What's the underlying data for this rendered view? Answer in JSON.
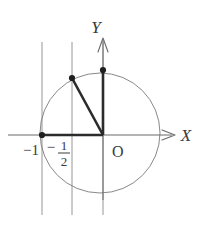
{
  "figure": {
    "axes": {
      "x_label": "X",
      "y_label": "Y",
      "origin_label": "O"
    },
    "tick_labels": [
      {
        "name": "minus-one",
        "text": "−1",
        "x": -1
      },
      {
        "name": "minus-one-half",
        "minus": "−",
        "numerator": "1",
        "denominator": "2",
        "x": -0.5
      }
    ],
    "colors": {
      "stroke_thin": "#6b6b6b",
      "stroke_thick": "#2b2b2b",
      "text": "#3a3a3a",
      "background": "#ffffff"
    },
    "geometry": {
      "circle": {
        "cx": 100,
        "cy": 133,
        "r": 60
      },
      "x_axis": {
        "y": 135,
        "x1": 8,
        "x2": 178
      },
      "y_axis": {
        "x": 103,
        "y1": 200,
        "y2": 38
      },
      "gridlines": [
        {
          "name": "gridline-minus-one",
          "x": 42,
          "y1": 42,
          "y2": 215
        },
        {
          "name": "gridline-minus-one-half",
          "x": 72,
          "y1": 42,
          "y2": 215
        },
        {
          "name": "gridline-y-axis",
          "x": 103,
          "y1": 42,
          "y2": 215
        }
      ],
      "points": [
        {
          "name": "point-minus-one",
          "x": 42,
          "y": 135
        },
        {
          "name": "point-upper-left",
          "x": 72,
          "y": 78
        },
        {
          "name": "point-top",
          "x": 103,
          "y": 70
        }
      ],
      "segments": [
        {
          "name": "segment-horizontal",
          "x1": 42,
          "y1": 135,
          "x2": 103,
          "y2": 135
        },
        {
          "name": "segment-vertical",
          "x1": 103,
          "y1": 70,
          "x2": 103,
          "y2": 135
        },
        {
          "name": "segment-diagonal",
          "x1": 72,
          "y1": 78,
          "x2": 103,
          "y2": 135
        }
      ]
    }
  }
}
